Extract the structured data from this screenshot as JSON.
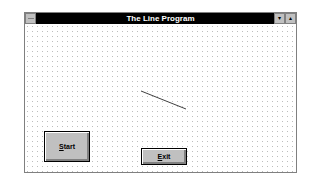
{
  "window": {
    "title": "The Line Program",
    "system_menu_icon": "system-menu-icon",
    "minimize_icon": "▾",
    "maximize_icon": "▴"
  },
  "buttons": {
    "start": {
      "mnemonic": "S",
      "rest": "tart"
    },
    "exit": {
      "mnemonic": "E",
      "rest": "xit"
    }
  },
  "colors": {
    "titlebar": "#000000",
    "title_text": "#ffffff",
    "button_face": "#c0c0c0",
    "line": "#404040"
  }
}
